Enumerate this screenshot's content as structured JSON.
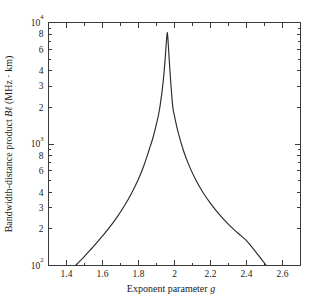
{
  "chart_data": {
    "type": "line",
    "title": "",
    "xlabel": "Exponent parameter g",
    "ylabel": "Bandwidth-distance product Bℓ (MHz · km)",
    "xlabel_parts": {
      "text": "Exponent parameter ",
      "italic": "g"
    },
    "ylabel_parts": {
      "lead": "Bandwidth-distance product ",
      "italic": "Bℓ",
      "trail": " (MHz · km)"
    },
    "xlim": [
      1.3,
      2.7
    ],
    "ylim": [
      100,
      10000
    ],
    "yscale": "log",
    "xscale": "linear",
    "grid": false,
    "legend": null,
    "xticks": [
      1.4,
      1.6,
      1.8,
      2.0,
      2.2,
      2.4,
      2.6
    ],
    "xtick_labels": [
      "1.4",
      "1.6",
      "1.8",
      "2",
      "2.2",
      "2.4",
      "2.6"
    ],
    "x_minor_ticks": [
      1.5,
      1.7,
      1.9,
      2.1,
      2.3,
      2.5
    ],
    "ytick_major": [
      100,
      1000,
      10000
    ],
    "ytick_major_labels": [
      "10²",
      "10³",
      "10⁴"
    ],
    "ytick_major_mantissa": [
      "10",
      "10",
      "10"
    ],
    "ytick_major_exponent": [
      "2",
      "3",
      "4"
    ],
    "ytick_minor_labeled": [
      200,
      300,
      400,
      600,
      800,
      2000,
      3000,
      4000,
      6000,
      8000
    ],
    "ytick_minor_labels": [
      "2",
      "3",
      "4",
      "6",
      "8",
      "2",
      "3",
      "4",
      "6",
      "8"
    ],
    "ytick_minor_unlabeled": [
      500,
      700,
      900,
      5000,
      7000,
      9000
    ],
    "peak": {
      "x": 1.96,
      "y": 8300,
      "label": ""
    },
    "curve_crossings_at_ymin": [
      1.45,
      2.51
    ],
    "series": [
      {
        "name": "Bℓ vs g",
        "color": "#2b2b2b",
        "x": [
          1.45,
          1.47,
          1.5,
          1.53,
          1.56,
          1.6,
          1.64,
          1.68,
          1.72,
          1.76,
          1.8,
          1.83,
          1.86,
          1.88,
          1.9,
          1.915,
          1.93,
          1.94,
          1.948,
          1.954,
          1.958,
          1.96,
          1.962,
          1.966,
          1.972,
          1.98,
          1.99,
          2.0,
          2.02,
          2.05,
          2.08,
          2.12,
          2.16,
          2.2,
          2.25,
          2.3,
          2.35,
          2.4,
          2.45,
          2.51
        ],
        "y": [
          100,
          107,
          119,
          133,
          149,
          175,
          207,
          249,
          307,
          390,
          515,
          665,
          905,
          1120,
          1470,
          1860,
          2650,
          3600,
          5000,
          6700,
          7900,
          8300,
          7900,
          6400,
          4600,
          3100,
          2050,
          1700,
          1250,
          880,
          670,
          500,
          395,
          325,
          262,
          218,
          186,
          160,
          130,
          100
        ]
      }
    ]
  },
  "figure": {
    "background_color": "#ffffff",
    "axis_color": "#3a3a3a",
    "curve_color": "#2b2b2b"
  }
}
